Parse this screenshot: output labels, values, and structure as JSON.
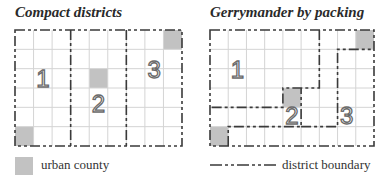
{
  "panels": [
    {
      "title": "Compact districts",
      "columns": 9,
      "rows": 6,
      "urban_cells": [
        [
          8,
          0
        ],
        [
          4,
          2
        ],
        [
          0,
          5
        ]
      ],
      "district_labels": [
        {
          "text": "1",
          "col": 1.5,
          "row": 2.5
        },
        {
          "text": "2",
          "col": 4.5,
          "row": 3.8
        },
        {
          "text": "3",
          "col": 7.5,
          "row": 2.0
        }
      ],
      "boundaries": [
        [
          [
            3,
            0
          ],
          [
            3,
            6
          ]
        ],
        [
          [
            6,
            0
          ],
          [
            6,
            6
          ]
        ]
      ]
    },
    {
      "title": "Gerrymander by packing",
      "columns": 9,
      "rows": 6,
      "urban_cells": [
        [
          8,
          0
        ],
        [
          4,
          3
        ],
        [
          0,
          5
        ]
      ],
      "district_labels": [
        {
          "text": "1",
          "col": 1.5,
          "row": 2.0
        },
        {
          "text": "2",
          "col": 4.5,
          "row": 4.4
        },
        {
          "text": "3",
          "col": 7.5,
          "row": 4.4
        }
      ],
      "boundaries": [
        [
          [
            6,
            0
          ],
          [
            6,
            3
          ],
          [
            4,
            3
          ],
          [
            4,
            4
          ],
          [
            0,
            4
          ]
        ],
        [
          [
            1,
            6
          ],
          [
            1,
            5
          ],
          [
            5,
            5
          ],
          [
            5,
            3
          ]
        ],
        [
          [
            5,
            5
          ],
          [
            7,
            5
          ],
          [
            7,
            1
          ],
          [
            9,
            1
          ]
        ]
      ]
    }
  ],
  "legend": {
    "urban_label": "urban county",
    "boundary_label": "district boundary"
  },
  "colors": {
    "urban": "#c2c2c2",
    "gridline": "#d4d4d4",
    "boundary": "#3a3a3a",
    "label": "#6a6a6a"
  }
}
